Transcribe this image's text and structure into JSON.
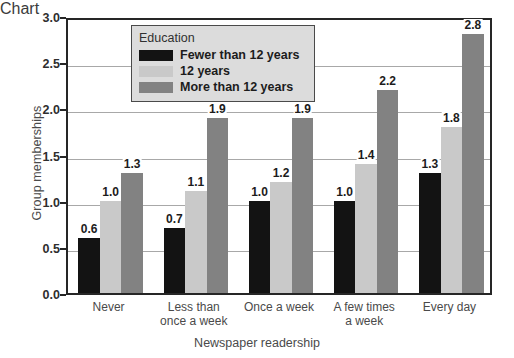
{
  "chart_data": {
    "type": "bar",
    "title": "",
    "xlabel": "Newspaper readership",
    "ylabel": "Group memberships",
    "categories": [
      "Never",
      "Less than\nonce a week",
      "Once a week",
      "A few times\na week",
      "Every day"
    ],
    "series": [
      {
        "name": "Fewer than 12 years",
        "color": "#131313",
        "values": [
          0.6,
          0.7,
          1.0,
          1.0,
          1.3
        ]
      },
      {
        "name": "12 years",
        "color": "#c9c9c9",
        "values": [
          1.0,
          1.1,
          1.2,
          1.4,
          1.8
        ]
      },
      {
        "name": "More than 12 years",
        "color": "#828282",
        "values": [
          1.3,
          1.9,
          1.9,
          2.2,
          2.8
        ]
      }
    ],
    "value_labels": [
      [
        "0.6",
        "1.0",
        "1.3"
      ],
      [
        "0.7",
        "1.1",
        "1.9"
      ],
      [
        "1.0",
        "1.2",
        "1.9"
      ],
      [
        "1.0",
        "1.4",
        "2.2"
      ],
      [
        "1.3",
        "1.8",
        "2.8"
      ]
    ],
    "ylim": [
      0.0,
      3.0
    ],
    "yticks": [
      0.0,
      0.5,
      1.0,
      1.5,
      2.0,
      2.5,
      3.0
    ],
    "ytick_labels": [
      "0.0",
      "0.5",
      "1.0",
      "1.5",
      "2.0",
      "2.5",
      "3.0"
    ],
    "grid": true,
    "grid_axis": "y",
    "legend": {
      "title": "Education",
      "position": "upper-center",
      "entries": [
        "Fewer than 12 years",
        "12 years",
        "More than 12 years"
      ]
    }
  }
}
